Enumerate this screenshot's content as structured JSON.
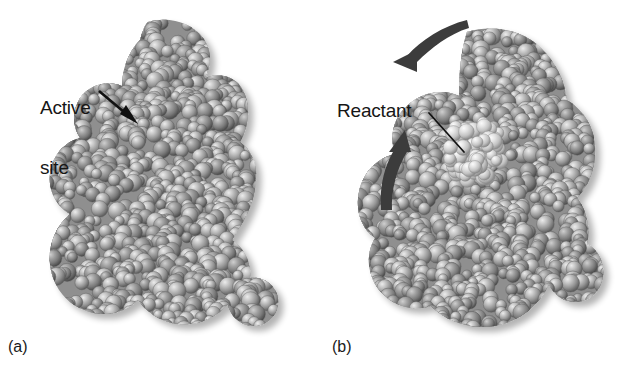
{
  "figure": {
    "background_color": "#ffffff",
    "width": 634,
    "height": 379
  },
  "panels": [
    {
      "id": "a",
      "caption": "(a)",
      "description": "Enzyme alone showing active site cleft",
      "annotation": {
        "label": "Active\nsite",
        "label_line_1": "Active",
        "label_line_2": "site",
        "pointer": "straight-arrow",
        "pointer_color": "#111111"
      }
    },
    {
      "id": "b",
      "caption": "(b)",
      "description": "Enzyme with reactant bound in active site",
      "annotation": {
        "label": "Reactant",
        "pointer": "thin-leader-line",
        "pointer_color": "#111111",
        "motion_arrows": 2,
        "motion_arrow_color": "#3a3a3a"
      }
    }
  ],
  "colors": {
    "sphere_base": "#9a9a9a",
    "sphere_highlight": "#e2e2e2",
    "sphere_shadow": "#5c5c5c",
    "reactant_highlight": "#cfcfcf",
    "text": "#161616",
    "background": "#ffffff"
  }
}
